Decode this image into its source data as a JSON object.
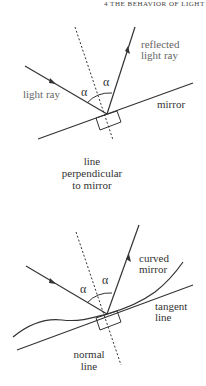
{
  "header": {
    "text": "4  THE BEHAVIOR OF LIGHT"
  },
  "diagram_top": {
    "reflected_label": [
      "reflected",
      "light ray"
    ],
    "incident_label": "light ray",
    "mirror_label": "mirror",
    "normal_label": [
      "line",
      "perpendicular",
      "to mirror"
    ],
    "angle_left": "α",
    "angle_right": "α"
  },
  "diagram_bottom": {
    "curved_label": [
      "curved",
      "mirror"
    ],
    "tangent_label": [
      "tangent",
      "line"
    ],
    "normal_label": [
      "normal",
      "line"
    ],
    "angle_left": "α",
    "angle_right": "α"
  },
  "colors": {
    "line": "#333333",
    "text": "#333333",
    "text_gray": "#666666"
  }
}
